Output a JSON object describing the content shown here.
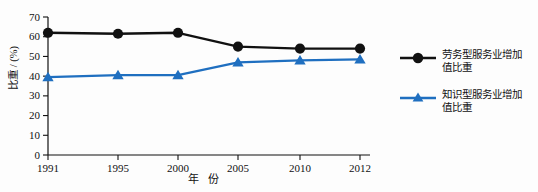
{
  "chart_data": {
    "type": "line",
    "title": "",
    "xlabel": "年 份",
    "ylabel": "比重 / (%)",
    "categories": [
      "1991",
      "1995",
      "2000",
      "2005",
      "2010",
      "2012"
    ],
    "x": [
      1991,
      1995,
      2000,
      2005,
      2010,
      2012
    ],
    "ylim": [
      0,
      70
    ],
    "yticks": [
      0,
      10,
      20,
      30,
      40,
      50,
      60,
      70
    ],
    "ytick_labels": [
      "0",
      "10",
      "20",
      "30",
      "40",
      "50",
      "60",
      "70"
    ],
    "grid": false,
    "legend_position": "right",
    "series": [
      {
        "name": "劳务型服务业增加值比重",
        "color": "#111111",
        "marker": "circle",
        "values": [
          62.0,
          61.5,
          62.0,
          55.0,
          54.0,
          54.0
        ]
      },
      {
        "name": "知识型服务业增加值比重",
        "color": "#1f6fc0",
        "marker": "triangle",
        "values": [
          39.5,
          40.5,
          40.5,
          47.0,
          48.0,
          48.5
        ]
      }
    ]
  },
  "legend": {
    "entries": [
      {
        "label_line1": "劳务型服务业增加",
        "label_line2": "值比重"
      },
      {
        "label_line1": "知识型服务业增加",
        "label_line2": "值比重"
      }
    ]
  },
  "axes": {
    "y_title": "比重 / (%)",
    "x_title": "年 份"
  }
}
